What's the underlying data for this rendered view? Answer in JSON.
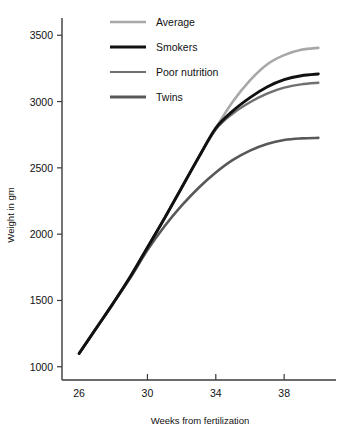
{
  "chart_data": {
    "type": "line",
    "title": "",
    "xlabel": "Weeks from fertilization",
    "ylabel": "Weight in gm",
    "xlim": [
      25.0,
      40.8
    ],
    "ylim": [
      900,
      3600
    ],
    "xticks": [
      26,
      30,
      34,
      38
    ],
    "xtick_labels": [
      "26",
      "30",
      "34",
      "38"
    ],
    "yticks": [
      1000,
      1500,
      2000,
      2500,
      3000,
      3500
    ],
    "ytick_labels": [
      "1000",
      "1500",
      "2000",
      "2500",
      "3000",
      "3500"
    ],
    "grid": false,
    "legend_position": "top-left",
    "x": [
      26,
      27,
      28,
      29,
      30,
      31,
      32,
      33,
      34,
      35,
      36,
      37,
      38,
      39,
      40
    ],
    "series": [
      {
        "name": "Average",
        "color": "#a8a8a8",
        "width": 2.6,
        "values": [
          1100,
          1290,
          1480,
          1680,
          1900,
          2120,
          2350,
          2580,
          2800,
          3000,
          3160,
          3280,
          3350,
          3390,
          3405
        ]
      },
      {
        "name": "Smokers",
        "color": "#111111",
        "width": 2.9,
        "values": [
          1100,
          1290,
          1480,
          1680,
          1900,
          2120,
          2350,
          2580,
          2800,
          2930,
          3030,
          3110,
          3165,
          3195,
          3208
        ]
      },
      {
        "name": "Poor nutrition",
        "color": "#707070",
        "width": 2.4,
        "values": [
          1100,
          1290,
          1480,
          1680,
          1900,
          2120,
          2350,
          2580,
          2790,
          2910,
          2995,
          3060,
          3105,
          3130,
          3142
        ]
      },
      {
        "name": "Twins",
        "color": "#585858",
        "width": 2.6,
        "values": [
          1100,
          1290,
          1480,
          1670,
          1880,
          2060,
          2215,
          2350,
          2465,
          2560,
          2630,
          2680,
          2710,
          2722,
          2726
        ]
      }
    ]
  },
  "legend": {
    "entries": [
      {
        "label": "Average",
        "swatch": "#a8a8a8",
        "width": 2.6
      },
      {
        "label": "Smokers",
        "swatch": "#111111",
        "width": 3.2
      },
      {
        "label": "Poor nutrition",
        "swatch": "#707070",
        "width": 2.2
      },
      {
        "label": "Twins",
        "swatch": "#585858",
        "width": 2.8
      }
    ]
  }
}
